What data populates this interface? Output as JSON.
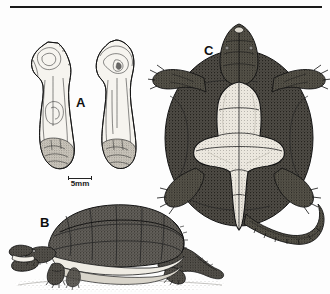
{
  "figure": {
    "kind": "scientific-plate",
    "background_color": "#fdfdfd",
    "ink_color": "#1a1a1a",
    "top_rule": {
      "present": true,
      "color": "#1a1a1a"
    },
    "panels": [
      {
        "id": "A",
        "label": "A",
        "subject": "pair of limb bones (humeri) in two views, stippled line drawing",
        "position": "upper-left"
      },
      {
        "id": "B",
        "label": "B",
        "subject": "snapping turtle, lateral view with open mouth, standing on ground",
        "position": "lower-left"
      },
      {
        "id": "C",
        "label": "C",
        "subject": "snapping turtle, ventral view showing cruciform plastron and long serrated tail",
        "position": "right"
      }
    ],
    "scale_bar": {
      "label": "5mm",
      "position": "below panel A",
      "tick_ends": true
    }
  }
}
